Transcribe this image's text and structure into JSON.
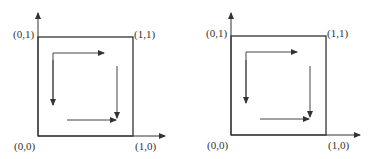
{
  "panels": [
    {
      "name": "left-panel",
      "labels": {
        "origin": "(0,0)",
        "top_left": "(0,1)",
        "top_right": "(1,1)",
        "bottom_right": "(1,0)"
      },
      "geom": {
        "ox": 38,
        "oy": 136,
        "size_x": 95,
        "size_y": 99,
        "axis_x_end": 165,
        "axis_y_end": 13
      }
    },
    {
      "name": "right-panel",
      "labels": {
        "origin": "(0,0)",
        "top_left": "(0,1)",
        "top_right": "(1,1)",
        "bottom_right": "(1,0)"
      },
      "geom": {
        "ox": 231,
        "oy": 135,
        "size_x": 95,
        "size_y": 99,
        "axis_x_end": 360,
        "axis_y_end": 13
      }
    }
  ],
  "colors": {
    "line": "#333333",
    "arrow": "#444444"
  }
}
